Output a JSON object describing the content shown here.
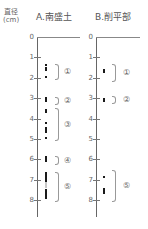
{
  "y_axis_label": {
    "line1": "直径",
    "line2": "(cm)"
  },
  "ticks": [
    "0",
    "1",
    "2",
    "3",
    "4",
    "5",
    "6",
    "7",
    "8"
  ],
  "columns": [
    {
      "title": "A.南盛土",
      "groups": [
        {
          "label": "①",
          "range_cm": [
            1.3,
            2.0
          ],
          "dots_cm": [
            1.35,
            1.5,
            1.6,
            1.95
          ]
        },
        {
          "label": "②",
          "range_cm": [
            2.95,
            3.25
          ],
          "dots_cm": [
            2.98,
            3.02,
            3.06,
            3.1,
            3.14
          ]
        },
        {
          "label": "③",
          "range_cm": [
            3.5,
            5.0
          ],
          "dots_cm": [
            3.6,
            3.7,
            4.2,
            4.45,
            4.55,
            4.65,
            4.95
          ]
        },
        {
          "label": "④",
          "range_cm": [
            5.85,
            6.2
          ],
          "dots_cm": [
            5.9,
            6.0,
            6.1
          ]
        },
        {
          "label": "⑤",
          "range_cm": [
            6.6,
            8.0
          ],
          "dots_cm": [
            6.65,
            6.75,
            6.85,
            6.95,
            7.05,
            7.5,
            7.6,
            7.7,
            7.8,
            7.9
          ],
          "faint_dots_cm": [
            7.15,
            7.25,
            7.35
          ]
        }
      ]
    },
    {
      "title": "B.削平部",
      "groups": [
        {
          "label": "①",
          "range_cm": [
            1.3,
            2.1
          ],
          "dots_cm": [
            1.6,
            1.72
          ]
        },
        {
          "label": "②",
          "range_cm": [
            2.9,
            3.2
          ],
          "dots_cm": [
            3.02,
            3.12
          ]
        },
        {
          "label": "⑤",
          "range_cm": [
            6.5,
            8.0
          ],
          "dots_cm": [
            6.85,
            7.45,
            7.55,
            7.65
          ]
        }
      ]
    }
  ]
}
